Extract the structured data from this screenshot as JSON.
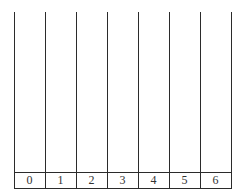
{
  "diagram": {
    "type": "number-line-table",
    "header_text_clipped": "",
    "columns": 7,
    "labels": [
      "0",
      "1",
      "2",
      "3",
      "4",
      "5",
      "6"
    ],
    "line_color": "#2b2b2b",
    "text_color": "#333333"
  }
}
